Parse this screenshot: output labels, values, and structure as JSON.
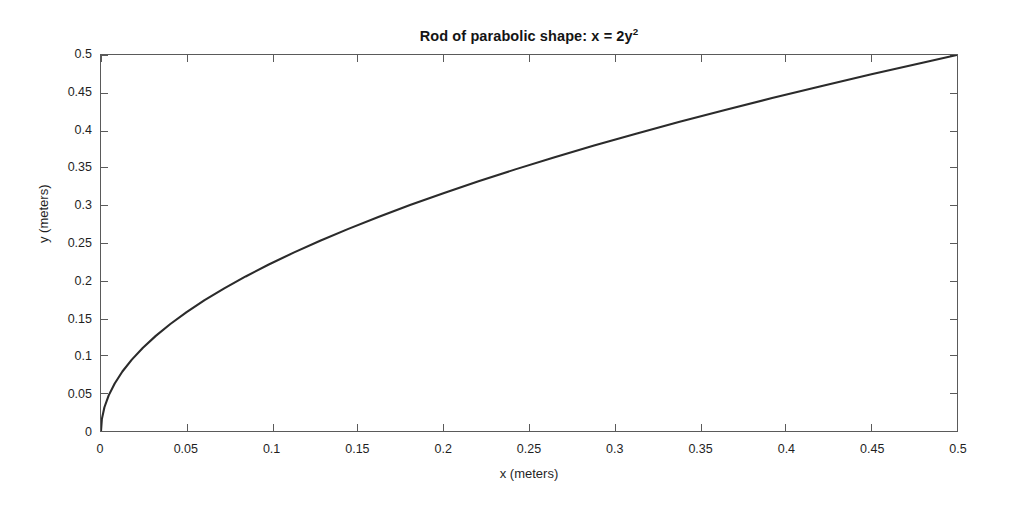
{
  "chart_data": {
    "type": "line",
    "title": "Rod of parabolic shape: x = 2y",
    "title_exponent": "2",
    "title_full": "Rod of parabolic shape: x = 2y^2",
    "xlabel": "x (meters)",
    "ylabel": "y (meters)",
    "xlim": [
      0,
      0.5
    ],
    "ylim": [
      0,
      0.5
    ],
    "grid": false,
    "legend": null,
    "box": true,
    "tick_direction": "in",
    "line_color": "#2b2b2b",
    "background_color": "#ffffff",
    "axis_color": "#5a5a5a",
    "equation": "x = 2y^2",
    "relation": "y = sqrt(x/2)",
    "xticks": [
      0,
      0.05,
      0.1,
      0.15,
      0.2,
      0.25,
      0.3,
      0.35,
      0.4,
      0.45,
      0.5
    ],
    "xtick_labels": [
      "0",
      "0.05",
      "0.1",
      "0.15",
      "0.2",
      "0.25",
      "0.3",
      "0.35",
      "0.4",
      "0.45",
      "0.5"
    ],
    "yticks": [
      0,
      0.05,
      0.1,
      0.15,
      0.2,
      0.25,
      0.3,
      0.35,
      0.4,
      0.45,
      0.5
    ],
    "ytick_labels": [
      "0",
      "0.05",
      "0.1",
      "0.15",
      "0.2",
      "0.25",
      "0.3",
      "0.35",
      "0.4",
      "0.45",
      "0.5"
    ],
    "series": [
      {
        "name": "x = 2y^2",
        "x": [
          0,
          0.0005,
          0.002,
          0.0045,
          0.008,
          0.0125,
          0.018,
          0.0245,
          0.032,
          0.0405,
          0.05,
          0.0605,
          0.072,
          0.0845,
          0.098,
          0.1125,
          0.128,
          0.1445,
          0.162,
          0.1805,
          0.2,
          0.2205,
          0.242,
          0.2645,
          0.288,
          0.3125,
          0.338,
          0.3645,
          0.392,
          0.4205,
          0.45,
          0.4805,
          0.5
        ],
        "y": [
          0,
          0.0158,
          0.0316,
          0.0474,
          0.0632,
          0.0791,
          0.0949,
          0.1107,
          0.1265,
          0.1423,
          0.1581,
          0.1739,
          0.1897,
          0.2055,
          0.2214,
          0.2372,
          0.253,
          0.2688,
          0.2846,
          0.3004,
          0.3162,
          0.332,
          0.3479,
          0.3637,
          0.3795,
          0.3953,
          0.4111,
          0.4269,
          0.4427,
          0.4585,
          0.4743,
          0.4901,
          0.5
        ]
      }
    ]
  }
}
